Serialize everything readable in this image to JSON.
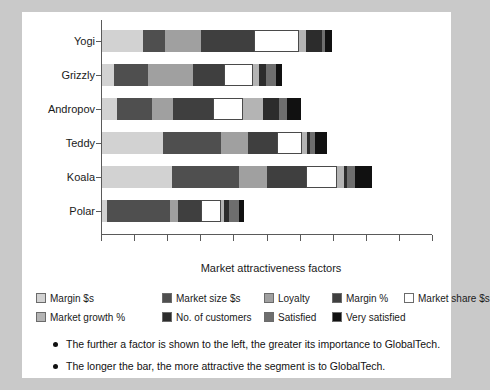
{
  "chart_data": {
    "type": "bar",
    "orientation": "horizontal",
    "stacked": true,
    "title": "",
    "xlabel": "Market attractiveness factors",
    "ylabel": "",
    "categories": [
      "Yogi",
      "Grizzly",
      "Andropov",
      "Teddy",
      "Koala",
      "Polar"
    ],
    "xlim": [
      0,
      100
    ],
    "xticks": [
      0,
      10,
      20,
      30,
      40,
      50,
      60,
      70,
      80,
      90,
      100
    ],
    "xticklabels": [
      "",
      "",
      "",
      "",
      "",
      "",
      "",
      "",
      "",
      "",
      ""
    ],
    "grid": false,
    "legend_position": "below-axes",
    "series": [
      {
        "name": "Margin $s",
        "color": "#d2d2d2",
        "values": [
          12.5,
          3.5,
          4.5,
          18.5,
          21.0,
          1.5
        ]
      },
      {
        "name": "Market size $s",
        "color": "#4f4f4f",
        "values": [
          6.5,
          10.5,
          10.5,
          17.5,
          20.5,
          19.0
        ]
      },
      {
        "name": "Loyalty",
        "color": "#a0a0a0",
        "values": [
          11.0,
          13.5,
          6.5,
          8.0,
          8.5,
          2.5
        ]
      },
      {
        "name": "Margin %",
        "color": "#3f3f3f",
        "values": [
          16.0,
          9.5,
          12.0,
          9.0,
          11.5,
          7.0
        ]
      },
      {
        "name": "Market share $s",
        "color": "#ffffff",
        "values": [
          13.5,
          8.5,
          9.0,
          7.5,
          9.5,
          6.0
        ]
      },
      {
        "name": "Market growth %",
        "color": "#b4b4b4",
        "values": [
          2.0,
          2.0,
          6.0,
          1.5,
          2.0,
          1.0
        ]
      },
      {
        "name": "No. of customers",
        "color": "#2c2c2c",
        "values": [
          5.0,
          2.0,
          5.0,
          1.0,
          1.0,
          1.5
        ]
      },
      {
        "name": "Satisfied",
        "color": "#6e6e6e",
        "values": [
          1.0,
          3.0,
          2.5,
          1.5,
          2.5,
          3.0
        ]
      },
      {
        "name": "Very satisfied",
        "color": "#111111",
        "values": [
          2.0,
          2.0,
          4.0,
          3.5,
          5.0,
          1.5
        ]
      }
    ],
    "totals": [
      69.5,
      54.5,
      60.0,
      68.0,
      81.5,
      43.0
    ],
    "annotations": [
      "The further a factor is shown to the left, the greater its importance to GlobalTech.",
      "The longer the bar, the more attractive the segment is to GlobalTech."
    ]
  },
  "legend": {
    "row1": [
      {
        "label": "Margin $s",
        "color": "#d2d2d2"
      },
      {
        "label": "Market size $s",
        "color": "#4f4f4f"
      },
      {
        "label": "Loyalty",
        "color": "#a0a0a0"
      },
      {
        "label": "Margin %",
        "color": "#3f3f3f"
      },
      {
        "label": "Market share $s",
        "color": "#ffffff"
      }
    ],
    "row2": [
      {
        "label": "Market growth %",
        "color": "#b4b4b4"
      },
      {
        "label": "No. of customers",
        "color": "#2c2c2c"
      },
      {
        "label": "Satisfied",
        "color": "#6e6e6e"
      },
      {
        "label": "Very satisfied",
        "color": "#111111"
      }
    ]
  },
  "notes": [
    "The further a factor is shown to the left, the greater its importance to GlobalTech.",
    "The longer the bar, the more attractive the segment is to GlobalTech."
  ],
  "axis": {
    "xtitle": "Market attractiveness factors"
  }
}
